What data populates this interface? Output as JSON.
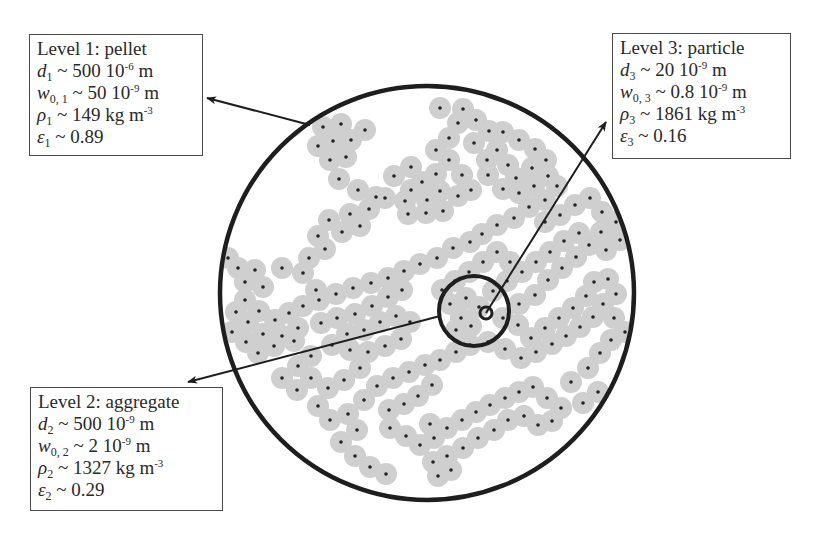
{
  "diagram": {
    "colors": {
      "outline": "#1e1e1e",
      "particle_halo": "#cfcfcf",
      "particle_core": "#222222",
      "box_border": "#4a4a4a",
      "text": "#2a2a2a"
    },
    "circles": {
      "pellet": {
        "cx": 427,
        "cy": 293,
        "r": 207,
        "stroke_width": 4.5
      },
      "aggregate": {
        "cx": 474,
        "cy": 311,
        "r": 35,
        "stroke_width": 4
      },
      "particle": {
        "cx": 486,
        "cy": 313,
        "r": 6,
        "stroke_width": 3
      }
    },
    "arrows": [
      {
        "name": "pellet-arrow",
        "from": [
          310,
          125
        ],
        "to": [
          207,
          98
        ]
      },
      {
        "name": "aggregate-arrow",
        "from": [
          440,
          316
        ],
        "to": [
          188,
          382
        ]
      },
      {
        "name": "particle-arrow",
        "from": [
          486,
          313
        ],
        "to": [
          606,
          122
        ]
      }
    ],
    "levels": [
      {
        "id": "l1",
        "heading": "Level 1: pellet",
        "rows": [
          {
            "sym": "d",
            "sub": "1",
            "op": " ~ ",
            "val": "500 10",
            "exp": "-6",
            "unit": " m"
          },
          {
            "sym": "w",
            "sub": "0, 1",
            "op": " ~ ",
            "val": "50 10",
            "exp": "-9",
            "unit": " m"
          },
          {
            "sym": "ρ",
            "sub": "1",
            "op": " ~ ",
            "val": "149 kg m",
            "exp": "-3",
            "unit": ""
          },
          {
            "sym": "ε",
            "sub": "1",
            "op": " ~ ",
            "val": "0.89",
            "exp": "",
            "unit": ""
          }
        ]
      },
      {
        "id": "l2",
        "heading": "Level 2: aggregate",
        "rows": [
          {
            "sym": "d",
            "sub": "2",
            "op": " ~ ",
            "val": "500 10",
            "exp": "-9",
            "unit": " m"
          },
          {
            "sym": "w",
            "sub": "0, 2",
            "op": " ~ ",
            "val": "2 10",
            "exp": "-9",
            "unit": " m"
          },
          {
            "sym": "ρ",
            "sub": "2",
            "op": " ~ ",
            "val": "1327 kg m",
            "exp": "-3",
            "unit": ""
          },
          {
            "sym": "ε",
            "sub": "2",
            "op": " ~ ",
            "val": "0.29",
            "exp": "",
            "unit": ""
          }
        ]
      },
      {
        "id": "l3",
        "heading": "Level 3: particle",
        "rows": [
          {
            "sym": "d",
            "sub": "3",
            "op": " ~ ",
            "val": "20 10",
            "exp": "-9",
            "unit": " m"
          },
          {
            "sym": "w",
            "sub": "0, 3",
            "op": " ~ ",
            "val": "0.8 10",
            "exp": "-9",
            "unit": " m"
          },
          {
            "sym": "ρ",
            "sub": "3",
            "op": " ~ ",
            "val": "1861 kg m",
            "exp": "-3",
            "unit": ""
          },
          {
            "sym": "ε",
            "sub": "3",
            "op": " ~ ",
            "val": "0.16",
            "exp": "",
            "unit": ""
          }
        ]
      }
    ],
    "particle_radius": 11,
    "particles": [
      [
        323,
        127
      ],
      [
        341,
        124
      ],
      [
        333,
        141
      ],
      [
        351,
        140
      ],
      [
        365,
        130
      ],
      [
        318,
        146
      ],
      [
        346,
        157
      ],
      [
        330,
        160
      ],
      [
        339,
        179
      ],
      [
        358,
        190
      ],
      [
        376,
        197
      ],
      [
        369,
        209
      ],
      [
        385,
        198
      ],
      [
        405,
        201
      ],
      [
        350,
        214
      ],
      [
        329,
        220
      ],
      [
        342,
        232
      ],
      [
        360,
        226
      ],
      [
        318,
        236
      ],
      [
        309,
        258
      ],
      [
        325,
        249
      ],
      [
        303,
        273
      ],
      [
        316,
        290
      ],
      [
        282,
        268
      ],
      [
        263,
        287
      ],
      [
        245,
        282
      ],
      [
        228,
        258
      ],
      [
        238,
        268
      ],
      [
        255,
        270
      ],
      [
        277,
        132
      ],
      [
        292,
        126
      ],
      [
        394,
        176
      ],
      [
        411,
        167
      ],
      [
        422,
        182
      ],
      [
        436,
        174
      ],
      [
        411,
        190
      ],
      [
        427,
        200
      ],
      [
        440,
        191
      ],
      [
        426,
        213
      ],
      [
        408,
        214
      ],
      [
        443,
        211
      ],
      [
        458,
        196
      ],
      [
        471,
        190
      ],
      [
        462,
        175
      ],
      [
        449,
        160
      ],
      [
        436,
        150
      ],
      [
        449,
        138
      ],
      [
        458,
        123
      ],
      [
        440,
        108
      ],
      [
        463,
        109
      ],
      [
        476,
        120
      ],
      [
        489,
        131
      ],
      [
        474,
        143
      ],
      [
        497,
        150
      ],
      [
        508,
        165
      ],
      [
        516,
        178
      ],
      [
        532,
        168
      ],
      [
        546,
        160
      ],
      [
        535,
        149
      ],
      [
        519,
        140
      ],
      [
        503,
        132
      ],
      [
        487,
        160
      ],
      [
        488,
        175
      ],
      [
        503,
        189
      ],
      [
        519,
        193
      ],
      [
        534,
        186
      ],
      [
        548,
        176
      ],
      [
        557,
        186
      ],
      [
        545,
        200
      ],
      [
        529,
        207
      ],
      [
        514,
        218
      ],
      [
        497,
        225
      ],
      [
        482,
        234
      ],
      [
        470,
        242
      ],
      [
        453,
        248
      ],
      [
        437,
        258
      ],
      [
        420,
        264
      ],
      [
        404,
        271
      ],
      [
        388,
        278
      ],
      [
        371,
        283
      ],
      [
        353,
        288
      ],
      [
        336,
        294
      ],
      [
        319,
        300
      ],
      [
        303,
        306
      ],
      [
        289,
        313
      ],
      [
        275,
        320
      ],
      [
        259,
        311
      ],
      [
        245,
        300
      ],
      [
        248,
        322
      ],
      [
        263,
        334
      ],
      [
        282,
        336
      ],
      [
        298,
        328
      ],
      [
        236,
        312
      ],
      [
        232,
        332
      ],
      [
        246,
        342
      ],
      [
        258,
        353
      ],
      [
        274,
        346
      ],
      [
        294,
        341
      ],
      [
        332,
        345
      ],
      [
        350,
        350
      ],
      [
        368,
        352
      ],
      [
        385,
        346
      ],
      [
        401,
        339
      ],
      [
        410,
        322
      ],
      [
        396,
        316
      ],
      [
        380,
        322
      ],
      [
        364,
        330
      ],
      [
        347,
        334
      ],
      [
        321,
        323
      ],
      [
        337,
        318
      ],
      [
        355,
        314
      ],
      [
        372,
        306
      ],
      [
        388,
        297
      ],
      [
        402,
        290
      ],
      [
        360,
        368
      ],
      [
        344,
        380
      ],
      [
        328,
        388
      ],
      [
        318,
        406
      ],
      [
        330,
        420
      ],
      [
        348,
        414
      ],
      [
        357,
        430
      ],
      [
        341,
        442
      ],
      [
        355,
        456
      ],
      [
        370,
        467
      ],
      [
        386,
        474
      ],
      [
        364,
        400
      ],
      [
        377,
        386
      ],
      [
        393,
        378
      ],
      [
        409,
        372
      ],
      [
        425,
        365
      ],
      [
        440,
        360
      ],
      [
        456,
        352
      ],
      [
        470,
        345
      ],
      [
        488,
        342
      ],
      [
        505,
        349
      ],
      [
        521,
        358
      ],
      [
        536,
        352
      ],
      [
        552,
        344
      ],
      [
        566,
        336
      ],
      [
        580,
        327
      ],
      [
        593,
        317
      ],
      [
        603,
        304
      ],
      [
        616,
        294
      ],
      [
        608,
        279
      ],
      [
        594,
        282
      ],
      [
        586,
        296
      ],
      [
        573,
        308
      ],
      [
        559,
        318
      ],
      [
        545,
        328
      ],
      [
        531,
        338
      ],
      [
        518,
        325
      ],
      [
        503,
        318
      ],
      [
        519,
        304
      ],
      [
        535,
        295
      ],
      [
        548,
        280
      ],
      [
        562,
        268
      ],
      [
        576,
        257
      ],
      [
        589,
        245
      ],
      [
        601,
        232
      ],
      [
        579,
        233
      ],
      [
        564,
        241
      ],
      [
        550,
        252
      ],
      [
        536,
        262
      ],
      [
        522,
        272
      ],
      [
        507,
        281
      ],
      [
        493,
        291
      ],
      [
        510,
        262
      ],
      [
        497,
        252
      ],
      [
        483,
        262
      ],
      [
        469,
        272
      ],
      [
        455,
        281
      ],
      [
        442,
        290
      ],
      [
        450,
        304
      ],
      [
        461,
        318
      ],
      [
        466,
        298
      ],
      [
        479,
        307
      ],
      [
        471,
        326
      ],
      [
        456,
        330
      ],
      [
        432,
        385
      ],
      [
        418,
        396
      ],
      [
        404,
        404
      ],
      [
        389,
        410
      ],
      [
        390,
        428
      ],
      [
        406,
        436
      ],
      [
        420,
        445
      ],
      [
        434,
        438
      ],
      [
        447,
        428
      ],
      [
        430,
        424
      ],
      [
        462,
        420
      ],
      [
        476,
        412
      ],
      [
        490,
        405
      ],
      [
        505,
        398
      ],
      [
        519,
        392
      ],
      [
        533,
        387
      ],
      [
        547,
        398
      ],
      [
        561,
        408
      ],
      [
        552,
        421
      ],
      [
        538,
        425
      ],
      [
        524,
        416
      ],
      [
        508,
        420
      ],
      [
        494,
        430
      ],
      [
        478,
        438
      ],
      [
        463,
        448
      ],
      [
        447,
        456
      ],
      [
        433,
        462
      ],
      [
        438,
        476
      ],
      [
        451,
        470
      ],
      [
        588,
        368
      ],
      [
        600,
        353
      ],
      [
        611,
        340
      ],
      [
        625,
        332
      ],
      [
        614,
        318
      ],
      [
        598,
        392
      ],
      [
        583,
        403
      ],
      [
        571,
        382
      ],
      [
        545,
        222
      ],
      [
        560,
        215
      ],
      [
        575,
        205
      ],
      [
        590,
        198
      ],
      [
        602,
        212
      ],
      [
        616,
        222
      ],
      [
        620,
        240
      ],
      [
        606,
        250
      ],
      [
        282,
        378
      ],
      [
        297,
        390
      ],
      [
        311,
        378
      ],
      [
        298,
        366
      ],
      [
        311,
        356
      ]
    ]
  }
}
